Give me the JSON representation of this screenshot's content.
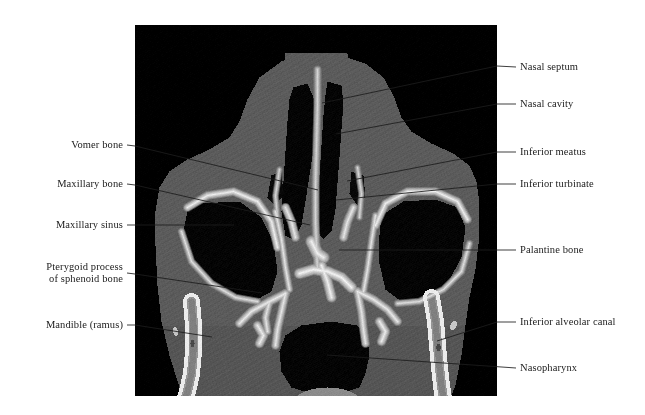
{
  "figure": {
    "modality": "CT",
    "view": "axial section through the nasal cavity and maxillary sinuses",
    "frame": {
      "x": 135,
      "y": 25,
      "width": 362,
      "height": 371
    },
    "background_color": "#000000",
    "page_background_color": "#ffffff",
    "label_color": "#1b1b1b",
    "leader_color": "#1c1c1c"
  },
  "labels": {
    "right": [
      {
        "id": "nasal-septum",
        "text": "Nasal septum",
        "text_x": 520,
        "text_y": 67,
        "leader": [
          [
            516,
            67
          ],
          [
            497,
            66
          ],
          [
            322,
            103
          ]
        ]
      },
      {
        "id": "nasal-cavity",
        "text": "Nasal cavity",
        "text_x": 520,
        "text_y": 104,
        "leader": [
          [
            516,
            104
          ],
          [
            497,
            104
          ],
          [
            336,
            134
          ]
        ]
      },
      {
        "id": "inferior-meatus",
        "text": "Inferior meatus",
        "text_x": 520,
        "text_y": 152,
        "leader": [
          [
            516,
            152
          ],
          [
            497,
            152
          ],
          [
            347,
            181
          ]
        ]
      },
      {
        "id": "inferior-turbinate",
        "text": "Inferior turbinate",
        "text_x": 520,
        "text_y": 184,
        "leader": [
          [
            516,
            184
          ],
          [
            497,
            184
          ],
          [
            336,
            200
          ]
        ]
      },
      {
        "id": "palantine-bone",
        "text": "Palantine bone",
        "text_x": 520,
        "text_y": 250,
        "leader": [
          [
            516,
            250
          ],
          [
            339,
            250
          ]
        ]
      },
      {
        "id": "inferior-alveolar-canal",
        "text": "Inferior alveolar canal",
        "text_x": 520,
        "text_y": 322,
        "leader": [
          [
            516,
            322
          ],
          [
            497,
            322
          ],
          [
            437,
            341
          ]
        ]
      },
      {
        "id": "nasopharynx",
        "text": "Nasopharynx",
        "text_x": 520,
        "text_y": 368,
        "leader": [
          [
            516,
            368
          ],
          [
            327,
            355
          ]
        ]
      }
    ],
    "left": [
      {
        "id": "vomer-bone",
        "text": "Vomer bone",
        "text_x": 123,
        "text_y": 145,
        "leader": [
          [
            127,
            145
          ],
          [
            135,
            146
          ],
          [
            318,
            190
          ]
        ]
      },
      {
        "id": "maxillary-bone",
        "text": "Maxillary bone",
        "text_x": 123,
        "text_y": 184,
        "leader": [
          [
            127,
            184
          ],
          [
            135,
            185
          ],
          [
            310,
            225
          ]
        ]
      },
      {
        "id": "maxillary-sinus",
        "text": "Maxillary sinus",
        "text_x": 123,
        "text_y": 225,
        "leader": [
          [
            127,
            225
          ],
          [
            234,
            225
          ]
        ]
      },
      {
        "id": "pterygoid-process-of-sphenoid-bone",
        "text": "Pterygoid process",
        "text2": "of sphenoid bone",
        "text_x": 123,
        "text_y": 273,
        "leader": [
          [
            127,
            273
          ],
          [
            135,
            274
          ],
          [
            262,
            293
          ]
        ]
      },
      {
        "id": "mandible-ramus",
        "text": "Mandible (ramus)",
        "text_x": 123,
        "text_y": 325,
        "leader": [
          [
            127,
            325
          ],
          [
            135,
            325
          ],
          [
            212,
            337
          ]
        ]
      }
    ]
  }
}
